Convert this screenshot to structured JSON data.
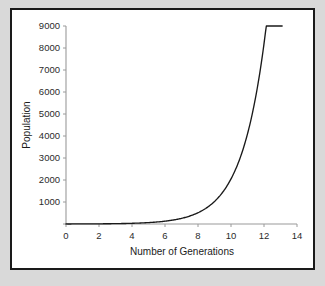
{
  "figure": {
    "background": "#ffffff",
    "border_color": "#1a1a1a",
    "outer_background": "#d9d9d9"
  },
  "chart_data": {
    "type": "line",
    "title": "",
    "xlabel": "Number of Generations",
    "ylabel": "Population",
    "xlim": [
      0,
      14
    ],
    "ylim": [
      0,
      9000
    ],
    "xticks": [
      0,
      2,
      4,
      6,
      8,
      10,
      12,
      14
    ],
    "xtick_labels": [
      "0",
      "2",
      "4",
      "6",
      "8",
      "10",
      "12",
      "14"
    ],
    "yticks": [
      0,
      1000,
      2000,
      3000,
      4000,
      5000,
      6000,
      7000,
      8000,
      9000
    ],
    "ytick_labels": [
      "",
      "1000",
      "2000",
      "3000",
      "4000",
      "5000",
      "6000",
      "7000",
      "8000",
      "9000"
    ],
    "grid": false,
    "legend": null,
    "series": [
      {
        "name": "Population",
        "color": "#1a1a1a",
        "description": "exponential growth, doubling each generation",
        "x": [
          0,
          1,
          2,
          3,
          4,
          5,
          6,
          7,
          8,
          9,
          10,
          10.5,
          11,
          11.5,
          12,
          12.5,
          13
        ],
        "values": [
          2,
          4,
          8,
          16,
          32,
          64,
          128,
          256,
          512,
          1024,
          2048,
          2896,
          4096,
          5793,
          8192,
          11585,
          8192
        ]
      }
    ],
    "series_plotted": {
      "name": "Population",
      "x": [
        0,
        1,
        2,
        3,
        4,
        5,
        6,
        7,
        8,
        9,
        10,
        10.5,
        11,
        11.5,
        12,
        12.5,
        13,
        13.1
      ],
      "y": [
        2,
        4,
        8,
        16,
        32,
        64,
        128,
        256,
        512,
        1024,
        2048,
        2896,
        4096,
        5793,
        6800,
        7500,
        8100,
        8200
      ]
    }
  },
  "axes": {
    "spine_color": "#9a9a9a",
    "tick_color": "#9a9a9a"
  }
}
